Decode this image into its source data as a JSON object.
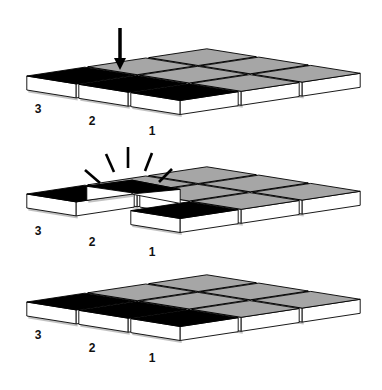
{
  "figure": {
    "colors": {
      "background": "#ffffff",
      "tile_top_active": "#000000",
      "tile_top_inactive": "#a6a6a6",
      "tile_side": "#ffffff",
      "outline": "#000000",
      "shadow": "#9a9a9a"
    },
    "panels": [
      {
        "id": "panel-top",
        "state": "pressed",
        "offset_y": 0,
        "arrow": {
          "x": 120,
          "y1": 28,
          "y2": 70
        },
        "labels": [
          {
            "text": "3",
            "x": 38,
            "y": 113
          },
          {
            "text": "2",
            "x": 92,
            "y": 125
          },
          {
            "text": "1",
            "x": 152,
            "y": 135
          }
        ]
      },
      {
        "id": "panel-middle",
        "state": "released",
        "offset_y": 118,
        "rays": [
          {
            "x1": 85,
            "y1": 170,
            "x2": 100,
            "y2": 183
          },
          {
            "x1": 106,
            "y1": 154,
            "x2": 114,
            "y2": 172
          },
          {
            "x1": 128,
            "y1": 147,
            "x2": 128,
            "y2": 168
          },
          {
            "x1": 152,
            "y1": 153,
            "x2": 145,
            "y2": 171
          },
          {
            "x1": 172,
            "y1": 169,
            "x2": 159,
            "y2": 182
          }
        ],
        "labels": [
          {
            "text": "3",
            "x": 38,
            "y": 235
          },
          {
            "text": "2",
            "x": 92,
            "y": 246
          },
          {
            "text": "1",
            "x": 152,
            "y": 256
          }
        ]
      },
      {
        "id": "panel-bottom",
        "state": "rest",
        "offset_y": 226,
        "labels": [
          {
            "text": "3",
            "x": 38,
            "y": 339
          },
          {
            "text": "2",
            "x": 92,
            "y": 352
          },
          {
            "text": "1",
            "x": 152,
            "y": 362
          }
        ]
      }
    ],
    "grid": {
      "origin": [
        24,
        76
      ],
      "u": [
        52,
        8.3
      ],
      "v": [
        61,
        -9.2
      ],
      "box_height": 14,
      "gap": 1.5,
      "active_tiles": [
        [
          0,
          0
        ],
        [
          1,
          0
        ],
        [
          2,
          0
        ]
      ]
    }
  }
}
